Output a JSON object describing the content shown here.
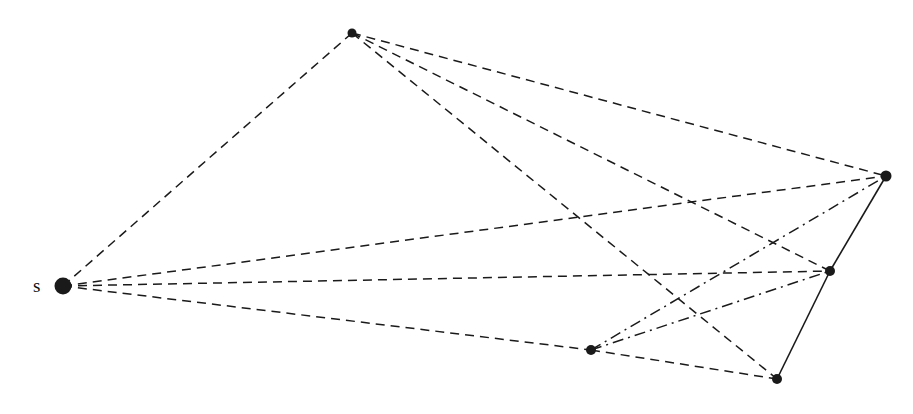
{
  "figure": {
    "width": 913,
    "height": 414,
    "background": "#ffffff",
    "ink_color": "#1a1a1a"
  },
  "nodes": [
    {
      "id": "s",
      "name": "source-node",
      "x": 63,
      "y": 286,
      "r": 8.5,
      "label": "s",
      "label_x": 33,
      "label_y": 276
    },
    {
      "id": "A",
      "name": "top-node",
      "x": 352,
      "y": 33,
      "r": 4.5,
      "label": "",
      "label_x": 0,
      "label_y": 0
    },
    {
      "id": "B",
      "name": "right-node",
      "x": 886,
      "y": 176,
      "r": 5.5,
      "label": "",
      "label_x": 0,
      "label_y": 0
    },
    {
      "id": "C",
      "name": "middle-right-node",
      "x": 830,
      "y": 271,
      "r": 5.0,
      "label": "",
      "label_x": 0,
      "label_y": 0
    },
    {
      "id": "D",
      "name": "bottom-left-node",
      "x": 591,
      "y": 350,
      "r": 5.0,
      "label": "",
      "label_x": 0,
      "label_y": 0
    },
    {
      "id": "E",
      "name": "bottom-right-node",
      "x": 777,
      "y": 379,
      "r": 5.0,
      "label": "",
      "label_x": 0,
      "label_y": 0
    }
  ],
  "edges": [
    {
      "name": "edge-s-A",
      "from": "s",
      "to": "A",
      "style": "dashed",
      "width": 1.5
    },
    {
      "name": "edge-s-B",
      "from": "s",
      "to": "B",
      "style": "dashed",
      "width": 1.5
    },
    {
      "name": "edge-s-C",
      "from": "s",
      "to": "C",
      "style": "dashed",
      "width": 1.5
    },
    {
      "name": "edge-s-D",
      "from": "s",
      "to": "D",
      "style": "dashed",
      "width": 1.5
    },
    {
      "name": "edge-D-E",
      "from": "D",
      "to": "E",
      "style": "dashed",
      "width": 1.5
    },
    {
      "name": "edge-A-B",
      "from": "A",
      "to": "B",
      "style": "dashed",
      "width": 1.5
    },
    {
      "name": "edge-A-C",
      "from": "A",
      "to": "C",
      "style": "dashed",
      "width": 1.5
    },
    {
      "name": "edge-A-E",
      "from": "A",
      "to": "E",
      "style": "dashed",
      "width": 1.5
    },
    {
      "name": "edge-D-B",
      "from": "D",
      "to": "B",
      "style": "dashdot",
      "width": 1.5
    },
    {
      "name": "edge-D-C",
      "from": "D",
      "to": "C",
      "style": "dashdot",
      "width": 1.5
    },
    {
      "name": "edge-B-C",
      "from": "B",
      "to": "C",
      "style": "solid",
      "width": 1.6
    },
    {
      "name": "edge-C-E",
      "from": "C",
      "to": "E",
      "style": "solid",
      "width": 1.6
    }
  ],
  "legend": {
    "styles": {
      "dashed": "dashed-edge",
      "dashdot": "dash-dot-edge",
      "solid": "solid-edge"
    }
  }
}
